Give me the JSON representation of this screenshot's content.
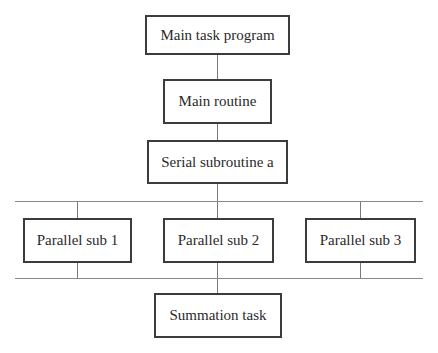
{
  "diagram": {
    "nodes": [
      {
        "id": "main_task",
        "label": "Main task program"
      },
      {
        "id": "main_routine",
        "label": "Main routine"
      },
      {
        "id": "serial_a",
        "label": "Serial subroutine a"
      },
      {
        "id": "par1",
        "label": "Parallel sub 1"
      },
      {
        "id": "par2",
        "label": "Parallel sub 2"
      },
      {
        "id": "par3",
        "label": "Parallel sub 3"
      },
      {
        "id": "summation",
        "label": "Summation task"
      }
    ],
    "edges": [
      {
        "from": "main_task",
        "to": "main_routine"
      },
      {
        "from": "main_routine",
        "to": "serial_a"
      },
      {
        "from": "serial_a",
        "to": "fork_bus"
      },
      {
        "from": "fork_bus",
        "to": "par1"
      },
      {
        "from": "fork_bus",
        "to": "par2"
      },
      {
        "from": "fork_bus",
        "to": "par3"
      },
      {
        "from": "par1",
        "to": "join_bus"
      },
      {
        "from": "par2",
        "to": "join_bus"
      },
      {
        "from": "par3",
        "to": "join_bus"
      },
      {
        "from": "join_bus",
        "to": "summation"
      }
    ]
  },
  "colors": {
    "box_border": "#3c3c3c",
    "connector": "#7a7a7a",
    "text": "#2a2a2a",
    "background": "#ffffff"
  }
}
